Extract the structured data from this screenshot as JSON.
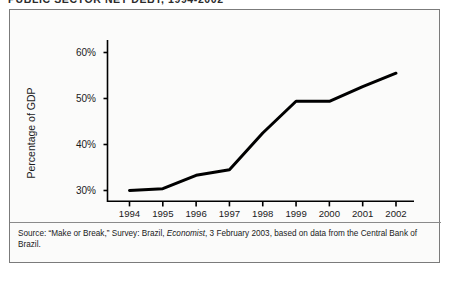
{
  "figure": {
    "title": "PUBLIC SECTOR NET DEBT, 1994-2002",
    "panel_border_color": "#7b7b7b",
    "panel_background": "#fbfbfa",
    "line_color": "#000000"
  },
  "source": {
    "prefix": "Source: “Make or Break,” Survey: Brazil, ",
    "publication": "Economist",
    "suffix": ", 3 February 2003, based on data from the Central Bank of Brazil."
  },
  "chart_data": {
    "type": "line",
    "title": "PUBLIC SECTOR NET DEBT, 1994-2002",
    "xlabel": "",
    "ylabel": "Percentage of GDP",
    "categories": [
      "1994",
      "1995",
      "1996",
      "1997",
      "1998",
      "1999",
      "2000",
      "2001",
      "2002"
    ],
    "x": [
      1994,
      1995,
      1996,
      1997,
      1998,
      1999,
      2000,
      2001,
      2002
    ],
    "values": [
      30.0,
      30.4,
      33.3,
      34.5,
      42.5,
      49.4,
      49.4,
      52.6,
      55.5
    ],
    "series": [
      {
        "name": "Public sector net debt",
        "values": [
          30.0,
          30.4,
          33.3,
          34.5,
          42.5,
          49.4,
          49.4,
          52.6,
          55.5
        ]
      }
    ],
    "ylim": [
      26,
      62
    ],
    "ytick_values": [
      30,
      40,
      50,
      60
    ],
    "ytick_labels": [
      "30%",
      "40%",
      "50%",
      "60%"
    ],
    "xtick_labels": [
      "1994",
      "1995",
      "1996",
      "1997",
      "1998",
      "1999",
      "2000",
      "2001",
      "2002"
    ],
    "grid": false,
    "legend": null,
    "legend_position": "none",
    "line_width": 3,
    "units": "percent of GDP"
  }
}
